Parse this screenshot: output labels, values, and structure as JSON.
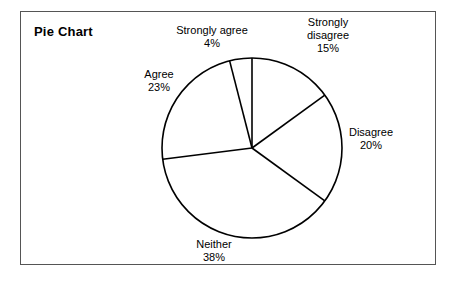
{
  "figure": {
    "title": "Pie Chart",
    "border_color": "#555555",
    "background": "#ffffff",
    "stroke_color": "#000000"
  },
  "chart_data": {
    "type": "pie",
    "title": "Pie Chart",
    "xlabel": "",
    "ylabel": "",
    "grid": false,
    "legend": "none",
    "labels_position": "outside",
    "start_angle_deg": 0,
    "direction": "clockwise",
    "center": [
      252,
      148
    ],
    "radius": 90,
    "categories": [
      "Strongly disagree",
      "Disagree",
      "Neither",
      "Agree",
      "Strongly agree"
    ],
    "values": [
      15,
      20,
      38,
      23,
      4
    ],
    "unit": "%",
    "slices": [
      {
        "label": "Strongly disagree",
        "value": 15,
        "value_text": "15%",
        "label_lines": [
          "Strongly",
          "disagree"
        ],
        "start_deg": 0,
        "end_deg": 54
      },
      {
        "label": "Disagree",
        "value": 20,
        "value_text": "20%",
        "label_lines": [
          "Disagree"
        ],
        "start_deg": 54,
        "end_deg": 126
      },
      {
        "label": "Neither",
        "value": 38,
        "value_text": "38%",
        "label_lines": [
          "Neither"
        ],
        "start_deg": 126,
        "end_deg": 262.8
      },
      {
        "label": "Agree",
        "value": 23,
        "value_text": "23%",
        "label_lines": [
          "Agree"
        ],
        "start_deg": 262.8,
        "end_deg": 345.6
      },
      {
        "label": "Strongly agree",
        "value": 4,
        "value_text": "4%",
        "label_lines": [
          "Strongly agree"
        ],
        "start_deg": 345.6,
        "end_deg": 360
      }
    ]
  },
  "labels": {
    "strongly_agree": {
      "name": "Strongly agree",
      "pct": "4%"
    },
    "strongly_disagree": {
      "line1": "Strongly",
      "line2": "disagree",
      "pct": "15%"
    },
    "agree": {
      "name": "Agree",
      "pct": "23%"
    },
    "disagree": {
      "name": "Disagree",
      "pct": "20%"
    },
    "neither": {
      "name": "Neither",
      "pct": "38%"
    }
  }
}
